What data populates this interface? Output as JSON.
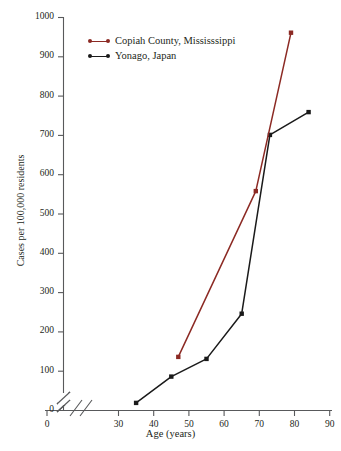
{
  "chart_data": {
    "type": "line",
    "title": "",
    "xlabel": "Age (years)",
    "ylabel": "Cases per 100,000 residents",
    "xlim": [
      30,
      90
    ],
    "ylim": [
      0,
      1000
    ],
    "x_ticks": [
      "0",
      "30",
      "40",
      "50",
      "60",
      "70",
      "80",
      "90"
    ],
    "y_ticks": [
      "0",
      "100",
      "200",
      "300",
      "400",
      "500",
      "600",
      "700",
      "800",
      "900",
      "1000"
    ],
    "grid": false,
    "axis_break_x": true,
    "axis_break_y": true,
    "legend_position": "upper-left-inside",
    "series": [
      {
        "name": "Copiah County, Mississsippi",
        "color": "#8c2a24",
        "x": [
          47,
          69,
          79
        ],
        "y": [
          135,
          557,
          960
        ]
      },
      {
        "name": "Yonago, Japan",
        "color": "#1a1a1a",
        "x": [
          35,
          45,
          55,
          65,
          73,
          84
        ],
        "y": [
          18,
          85,
          130,
          245,
          700,
          758
        ]
      }
    ]
  },
  "legend": {
    "items": [
      {
        "label": "Copiah County, Mississsippi",
        "color": "#8c2a24"
      },
      {
        "label": "Yonago, Japan",
        "color": "#1a1a1a"
      }
    ]
  },
  "axes": {
    "y_title": "Cases per 100,000 residents",
    "x_title": "Age (years)",
    "y_tick_labels": [
      "1000",
      "900",
      "800",
      "700",
      "600",
      "500",
      "400",
      "300",
      "200",
      "100",
      "0"
    ],
    "x_tick_labels": [
      "0",
      "30",
      "40",
      "50",
      "60",
      "70",
      "80",
      "90"
    ]
  }
}
